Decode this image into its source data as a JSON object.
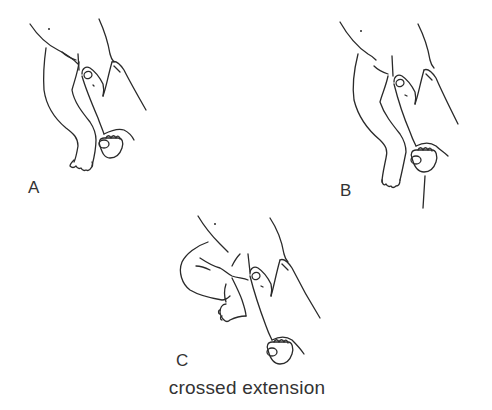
{
  "figure": {
    "panels": [
      {
        "id": "A",
        "label": "A",
        "description": "infant legs, examiner thumb pressing on one leg, foot held"
      },
      {
        "id": "B",
        "label": "B",
        "description": "infant legs, examiner thumb pressing, stimulus applied to sole"
      },
      {
        "id": "C",
        "label": "C",
        "description": "infant with free leg flexed and crossed, examiner holding other foot"
      }
    ],
    "caption": "crossed extension",
    "colors": {
      "line": "#2a2a2a",
      "text": "#333333",
      "background": "#ffffff"
    }
  }
}
